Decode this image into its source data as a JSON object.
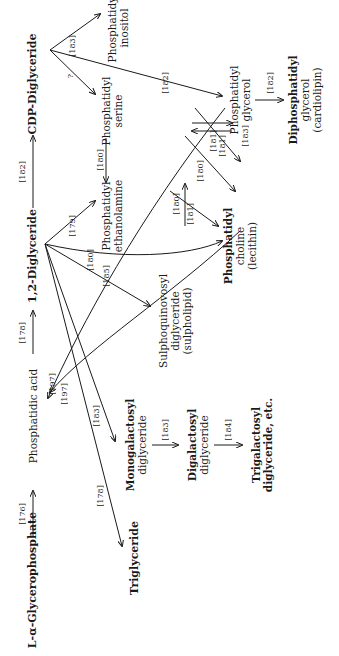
{
  "diagram": {
    "orientation": "rotated-90-ccw",
    "nodes": {
      "glycerophosphate": "L-α-Glycerophosphate",
      "phosphatidic_acid": "Phosphatidic acid",
      "diglyceride": "1,2-Diglyceride",
      "cdp_diglyceride": "CDP-Diglyceride",
      "pi_1": "Phosphatidyl",
      "pi_2": "inositol",
      "ps_1": "Phosphatidyl",
      "ps_2": "serine",
      "pe_1": "Phosphatidyl",
      "pe_2": "ethanolamine",
      "pg_1": "Phosphatidyl",
      "pg_2": "glycerol",
      "dpg_1": "Diphosphatidyl",
      "dpg_2": "glycerol",
      "dpg_3": "(cardiolipin)",
      "pc_1": "Phosphatidyl",
      "pc_2": "choline",
      "pc_3": "(lecithin)",
      "sq_1": "Sulphoquinovosyl",
      "sq_2": "diglyceride",
      "sq_3": "(sulpholipid)",
      "mg_1": "Monogalactosyl",
      "mg_2": "diglyceride",
      "dg_1": "Digalactosyl",
      "dg_2": "diglyceride",
      "tg_1": "Trigalactosyl",
      "tg_2": "diglyceride, etc.",
      "triglyceride": "Triglyceride"
    },
    "refs": {
      "r_gp_pa": "[176]",
      "r_pa_dg": "[178]",
      "r_dg_cdp": "[182]",
      "r_cdp_pi": "[183]",
      "r_cdp_ps": "?",
      "r_cdp_pg": "[182]",
      "r_pg_dpg": "[182]",
      "r_ps_pe": "[180]",
      "r_dg_pe": "[179]",
      "r_dg_pc_180": "[180]",
      "r_dg_sq": "[185]",
      "r_pe_pc": "[181]",
      "r_pc_pe": "[180]",
      "r_ps_pc_180": "[180]",
      "r_ps_pc_181": "[181]",
      "r_pg_pc_181": "[181]",
      "r_pc_pg_183": "[183]",
      "r_pa_197a": "[197]",
      "r_pa_197b": "[197]",
      "r_dg_mg": "[183]",
      "r_mg_dg": "[183]",
      "r_dgal_tgal": "[184]",
      "r_dg_tg": "[178]"
    },
    "colors": {
      "ink": "#1a1a1a",
      "background": "#ffffff"
    }
  }
}
